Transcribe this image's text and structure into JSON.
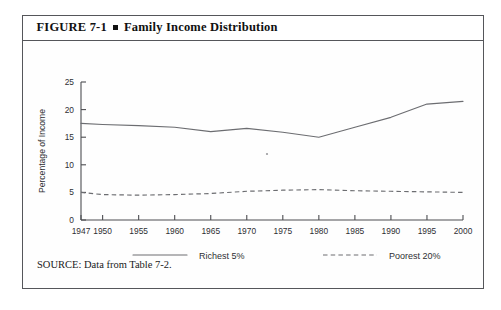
{
  "figure": {
    "label": "FIGURE  7-1",
    "bullet": "square-bullet",
    "title": "Family Income Distribution",
    "source": "SOURCE: Data from Table 7-2."
  },
  "chart_data": {
    "type": "line",
    "title": "Family Income Distribution",
    "xlabel": "",
    "ylabel": "Percentage of Income",
    "xlim": [
      1947,
      2000
    ],
    "ylim": [
      0,
      25
    ],
    "grid": false,
    "legend_position": "below-axis",
    "x_ticks": [
      1947,
      1950,
      1955,
      1960,
      1965,
      1970,
      1975,
      1980,
      1985,
      1990,
      1995,
      2000
    ],
    "x_tick_labels": [
      "1947",
      "1950",
      "1955",
      "1960",
      "1965",
      "1970",
      "1975",
      "1980",
      "1985",
      "1990",
      "1995",
      "2000"
    ],
    "y_ticks": [
      0,
      5,
      10,
      15,
      20,
      25
    ],
    "y_tick_labels": [
      "0",
      "5",
      "10",
      "15",
      "20",
      "25"
    ],
    "series": [
      {
        "name": "Richest 5%",
        "style": "solid",
        "x": [
          1947,
          1950,
          1955,
          1960,
          1965,
          1970,
          1975,
          1980,
          1985,
          1990,
          1995,
          2000
        ],
        "values": [
          17.5,
          17.3,
          17.1,
          16.8,
          16.0,
          16.6,
          15.9,
          15.0,
          16.8,
          18.6,
          21.0,
          21.5
        ]
      },
      {
        "name": "Poorest 20%",
        "style": "dashed",
        "x": [
          1947,
          1950,
          1955,
          1960,
          1965,
          1970,
          1975,
          1980,
          1985,
          1990,
          1995,
          2000
        ],
        "values": [
          5.0,
          4.6,
          4.5,
          4.6,
          4.8,
          5.2,
          5.4,
          5.5,
          5.3,
          5.2,
          5.1,
          5.0
        ]
      }
    ]
  },
  "legend": {
    "items": [
      {
        "label": "Richest 5%",
        "style": "solid"
      },
      {
        "label": "Poorest 20%",
        "style": "dashed"
      }
    ]
  }
}
